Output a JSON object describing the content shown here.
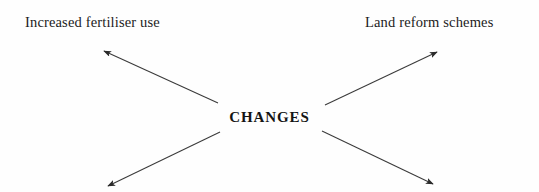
{
  "diagram": {
    "type": "radial-spoke",
    "background_color": "#fefefe",
    "line_color": "#3a3a3a",
    "text_color": "#1c1c1c",
    "hub": {
      "label": "CHANGES",
      "x": 272,
      "y": 119
    },
    "labels": {
      "top_left": "Increased fertiliser use",
      "top_right": "Land reform schemes"
    },
    "arrows": [
      {
        "name": "arrow-up-left",
        "direction": "up-left",
        "from_x": 218,
        "from_y": 103,
        "to_x": 104,
        "to_y": 51,
        "points_to": "Increased fertiliser use"
      },
      {
        "name": "arrow-up-right",
        "direction": "up-right",
        "from_x": 325,
        "from_y": 105,
        "to_x": 437,
        "to_y": 52,
        "points_to": "Land reform schemes"
      },
      {
        "name": "arrow-down-left",
        "direction": "down-left",
        "from_x": 220,
        "from_y": 132,
        "to_x": 108,
        "to_y": 186,
        "points_to": ""
      },
      {
        "name": "arrow-down-right",
        "direction": "down-right",
        "from_x": 322,
        "from_y": 131,
        "to_x": 433,
        "to_y": 184,
        "points_to": ""
      }
    ]
  }
}
